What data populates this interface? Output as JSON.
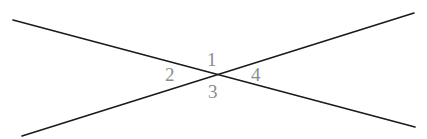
{
  "figure": {
    "name": "two-intersecting-lines-angle-diagram",
    "width": 427,
    "height": 139,
    "background_color": "#ffffff",
    "line_color": "#1a1a1a",
    "line_width": 1.6,
    "label_color": "#8c8c8c",
    "label_font_size": 19,
    "intersection": {
      "x": 216,
      "y": 76
    },
    "lines": [
      {
        "name": "descending-line",
        "description": "straight line from upper-left to lower-right",
        "x1": 13,
        "y1": 20,
        "x2": 415,
        "y2": 127,
        "slope": 0.266
      },
      {
        "name": "ascending-line",
        "description": "straight line from lower-left to upper-right",
        "x1": 22,
        "y1": 136,
        "x2": 414,
        "y2": 13,
        "slope": -0.314
      }
    ],
    "labels": [
      {
        "id": "1",
        "text": "1",
        "position": "top",
        "x": 215,
        "y": 59
      },
      {
        "id": "2",
        "text": "2",
        "position": "left",
        "x": 173,
        "y": 75
      },
      {
        "id": "3",
        "text": "3",
        "position": "bottom",
        "x": 215,
        "y": 92
      },
      {
        "id": "4",
        "text": "4",
        "position": "right",
        "x": 259,
        "y": 75
      }
    ]
  }
}
